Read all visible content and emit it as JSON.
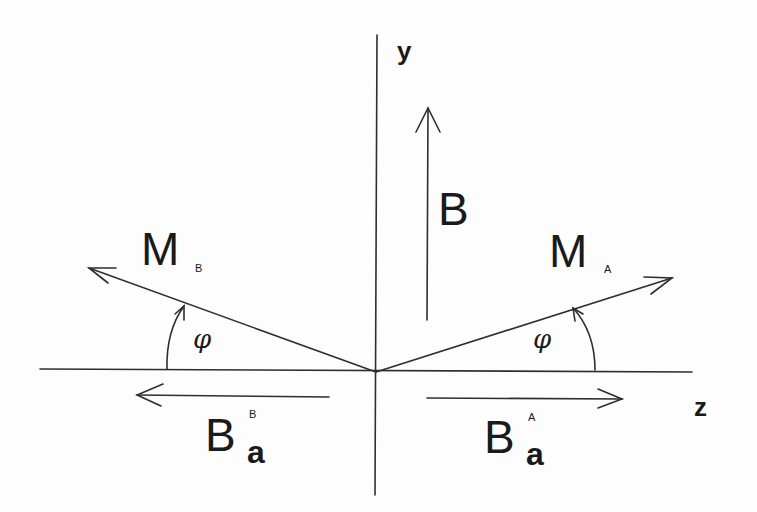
{
  "diagram": {
    "axes": {
      "y_label": "y",
      "z_label": "z"
    },
    "vectors": {
      "B": {
        "label": "B"
      },
      "M_A": {
        "label": "M",
        "subscript": "A"
      },
      "M_B": {
        "label": "M",
        "subscript": "B"
      },
      "Ba_A": {
        "label": "B",
        "subscript": "a",
        "superscript": "A"
      },
      "Ba_B": {
        "label": "B",
        "subscript": "a",
        "superscript": "B"
      }
    },
    "angles": {
      "left": "φ",
      "right": "φ"
    },
    "colors": {
      "ink": "#2a2a2a",
      "background": "#fdfdfd"
    }
  }
}
